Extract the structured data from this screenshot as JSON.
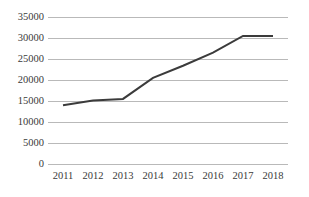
{
  "chart_data": {
    "type": "line",
    "title": "",
    "subtitle": "",
    "xlabel": "",
    "ylabel": "",
    "categories": [
      "2011",
      "2012",
      "2013",
      "2014",
      "2015",
      "2016",
      "2017",
      "2018"
    ],
    "values": [
      14000,
      15100,
      15500,
      20500,
      23400,
      26500,
      30500,
      30500
    ],
    "series": [
      {
        "name": "",
        "values": [
          14000,
          15100,
          15500,
          20500,
          23400,
          26500,
          30500,
          30500
        ],
        "color": "#3b3b3b"
      }
    ],
    "ylim": [
      0,
      35000
    ],
    "y_ticks": [
      0,
      5000,
      10000,
      15000,
      20000,
      25000,
      30000,
      35000
    ],
    "y_tick_labels": [
      "0",
      "5000",
      "10000",
      "15000",
      "20000",
      "25000",
      "30000",
      "35000"
    ],
    "x_tick_labels": [
      "2011",
      "2012",
      "2013",
      "2014",
      "2015",
      "2016",
      "2017",
      "2018"
    ],
    "grid": true,
    "grid_axis": "y",
    "grid_color": "#b9b9b9",
    "legend": false,
    "legend_position": "none",
    "line_color": "#3b3b3b",
    "line_width": 2,
    "markers": false,
    "background_color": "#ffffff",
    "text_color": "#3a3a3a",
    "annotations": []
  }
}
